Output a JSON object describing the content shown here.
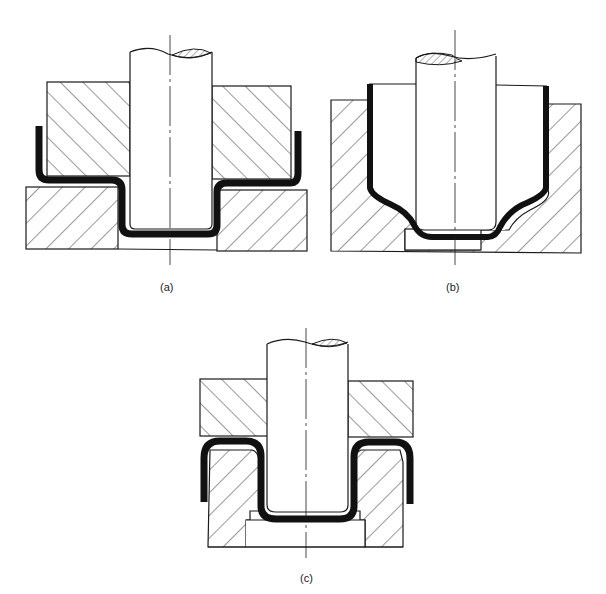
{
  "figure": {
    "panels": [
      {
        "id": "a",
        "label": "(a)",
        "description": "Direct redrawing – blank holder above die, punch pushing cup down through die opening"
      },
      {
        "id": "b",
        "label": "(b)",
        "description": "Drawing with tapered die – cup walls slope inward to punch nose"
      },
      {
        "id": "c",
        "label": "(c)",
        "description": "Reverse redrawing – cup inverted over die ring, punch draws it inside-out"
      }
    ],
    "colors": {
      "outline": "#1a1a1a",
      "sheet": "#111111",
      "hatch": "#333333",
      "background": "#ffffff"
    }
  }
}
